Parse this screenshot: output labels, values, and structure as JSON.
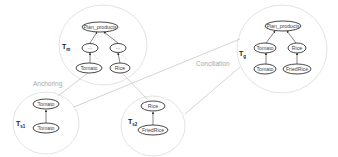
{
  "diagram": {
    "relations": {
      "anchoring": "Anchoring",
      "conciliation": "Conciliation"
    },
    "trees": {
      "tm": {
        "label": "T",
        "sub": "m",
        "root": "Plan_products",
        "mid_left": "...",
        "mid_right": "...",
        "leaf_left": "Tomato",
        "leaf_right": "Rice"
      },
      "tg": {
        "label": "T",
        "sub": "g",
        "root": "Plan_products",
        "mid_left": "Tomato",
        "mid_right": "Rice",
        "leaf_left": "Tomato",
        "leaf_right": "FriedRice"
      },
      "ts1": {
        "label": "T",
        "sub": "s1",
        "top": "Tomato",
        "bottom": "Tomato"
      },
      "ts2": {
        "label": "T",
        "sub": "s2",
        "top": "Rice",
        "bottom": "FriedRice"
      }
    },
    "colors": {
      "group_circle": "#e3e3e3",
      "link_line": "#c8c8c8",
      "node_stroke": "#333333",
      "relation_text": "#a8a8a8"
    }
  }
}
